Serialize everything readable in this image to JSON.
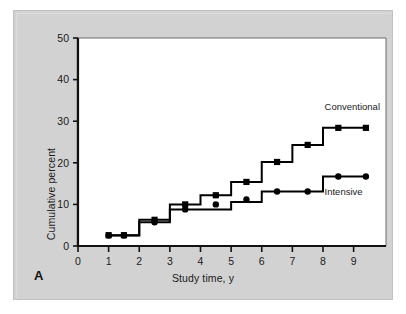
{
  "figure": {
    "panel_letter": "A",
    "background_color": "#d2d2d2",
    "plot_background_color": "#ffffff",
    "line_color": "#000000"
  },
  "chart_data": {
    "type": "line",
    "title": "",
    "subtitle": "",
    "xlabel": "Study time, y",
    "ylabel": "Cumulative percent",
    "xlim": [
      0,
      9.6
    ],
    "ylim": [
      0,
      50
    ],
    "xticks": [
      0,
      1,
      2,
      3,
      4,
      5,
      6,
      7,
      8,
      9
    ],
    "xticklabels": [
      "0",
      "1",
      "2",
      "3",
      "4",
      "5",
      "6",
      "7",
      "8",
      "9"
    ],
    "yticks": [
      0,
      10,
      20,
      30,
      40,
      50
    ],
    "yticklabels": [
      "0",
      "10",
      "20",
      "30",
      "40",
      "50"
    ],
    "grid": false,
    "legend_position": "inline-annotation",
    "drawstyle": "steps-post",
    "series": [
      {
        "name": "Conventional",
        "marker": "square",
        "label_x": 8.05,
        "label_y": 32.6,
        "x": [
          1.0,
          1.5,
          2.5,
          3.5,
          4.5,
          5.5,
          6.5,
          7.5,
          8.5,
          9.4
        ],
        "y": [
          2.6,
          2.6,
          6.3,
          10.0,
          12.2,
          15.4,
          20.2,
          24.3,
          28.4,
          28.4
        ],
        "step_x": [
          1.0,
          2.0,
          2.0,
          3.0,
          3.0,
          4.0,
          4.0,
          5.0,
          5.0,
          6.0,
          6.0,
          7.0,
          7.0,
          8.0,
          8.0,
          9.4
        ],
        "step_y": [
          2.6,
          2.6,
          6.3,
          6.3,
          10.0,
          10.0,
          12.2,
          12.2,
          15.4,
          15.4,
          20.2,
          20.2,
          24.3,
          24.3,
          28.4,
          28.4
        ]
      },
      {
        "name": "Intensive",
        "marker": "circle",
        "label_x": 8.05,
        "label_y": 12.2,
        "x": [
          1.0,
          1.5,
          2.5,
          3.5,
          4.5,
          5.5,
          6.5,
          7.5,
          8.5,
          9.4
        ],
        "y": [
          2.5,
          2.5,
          5.7,
          8.8,
          10.0,
          11.2,
          13.1,
          13.1,
          16.7,
          16.7
        ],
        "step_x": [
          1.0,
          2.0,
          2.0,
          3.0,
          3.0,
          4.0,
          4.0,
          5.0,
          5.0,
          6.0,
          6.0,
          7.0,
          7.0,
          8.0,
          8.0,
          9.4
        ],
        "step_y": [
          2.5,
          2.5,
          5.7,
          5.7,
          8.8,
          8.8,
          8.8,
          8.8,
          10.6,
          10.6,
          13.1,
          13.1,
          13.1,
          13.1,
          16.7,
          16.7
        ]
      }
    ],
    "annotations": [
      {
        "text": "Conventional",
        "x": 8.05,
        "y": 32.6
      },
      {
        "text": "Intensive",
        "x": 8.05,
        "y": 12.2
      }
    ]
  }
}
